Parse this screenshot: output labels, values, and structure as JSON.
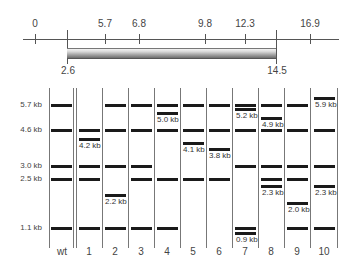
{
  "map": {
    "top_ticks": [
      {
        "label": "0",
        "x": 35
      },
      {
        "label": "5.7",
        "x": 105
      },
      {
        "label": "6.8",
        "x": 139
      },
      {
        "label": "9.8",
        "x": 205
      },
      {
        "label": "12.3",
        "x": 245
      },
      {
        "label": "16.9",
        "x": 310
      }
    ],
    "insert": {
      "start_label": "2.6",
      "end_label": "14.5",
      "start_x": 67,
      "end_x": 276
    }
  },
  "gel": {
    "size_markers": [
      {
        "label": "5.7 kb",
        "y": 105
      },
      {
        "label": "4.6 kb",
        "y": 130
      },
      {
        "label": "3.0 kb",
        "y": 166
      },
      {
        "label": "2.5 kb",
        "y": 179
      },
      {
        "label": "1.1 kb",
        "y": 228
      }
    ],
    "lanes": [
      {
        "label": "wt",
        "bands": [
          "5.7",
          "4.6",
          "3.0",
          "2.5",
          "1.1"
        ],
        "new_bands": []
      },
      {
        "label": "1",
        "bands": [
          "4.6",
          "3.0",
          "2.5",
          "1.1"
        ],
        "new_bands": [
          "4.2 kb"
        ]
      },
      {
        "label": "2",
        "bands": [
          "5.7",
          "4.6",
          "3.0",
          "1.1"
        ],
        "new_bands": [
          "2.2 kb"
        ]
      },
      {
        "label": "3",
        "bands": [
          "5.7",
          "4.6",
          "3.0",
          "2.5",
          "1.1"
        ],
        "new_bands": []
      },
      {
        "label": "4",
        "bands": [
          "5.7",
          "4.6",
          "2.5",
          "1.1"
        ],
        "new_bands": [
          "5.0 kb"
        ]
      },
      {
        "label": "5",
        "bands": [
          "5.7",
          "4.6",
          "2.5"
        ],
        "new_bands": [
          "4.1 kb"
        ]
      },
      {
        "label": "6",
        "bands": [
          "5.7",
          "4.6",
          "2.5"
        ],
        "new_bands": [
          "3.8 kb"
        ]
      },
      {
        "label": "7",
        "bands": [
          "5.7",
          "4.6",
          "3.0",
          "1.1"
        ],
        "new_bands": [
          "5.2 kb",
          "0.9 kb"
        ]
      },
      {
        "label": "8",
        "bands": [
          "5.7",
          "4.6",
          "3.0",
          "2.5"
        ],
        "new_bands": [
          "4.9 kb",
          "2.3 kb"
        ]
      },
      {
        "label": "9",
        "bands": [
          "5.7",
          "4.6",
          "3.0",
          "2.5",
          "1.1"
        ],
        "new_bands": [
          "2.0 kb"
        ]
      },
      {
        "label": "10",
        "bands": [
          "4.6",
          "3.0",
          "1.1"
        ],
        "new_bands": [
          "5.9 kb",
          "2.3 kb"
        ]
      }
    ]
  }
}
